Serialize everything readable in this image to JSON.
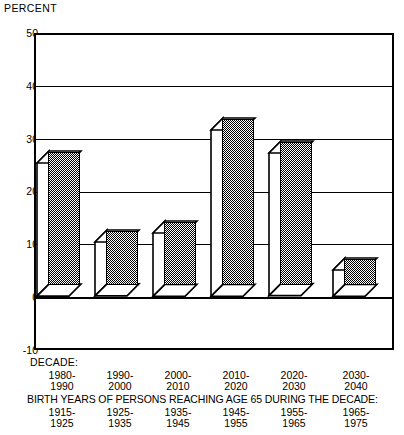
{
  "chart_data": {
    "type": "bar",
    "title": "",
    "ylabel": "PERCENT",
    "xlabel": "",
    "ylim": [
      -10,
      50
    ],
    "yticks": [
      50,
      40,
      30,
      20,
      10,
      0,
      -10
    ],
    "grid": true,
    "legend": false,
    "categories": [
      "1980-\n1990",
      "1990-\n2000",
      "2000-\n2010",
      "2010-\n2020",
      "2020-\n2030",
      "2030-\n2040"
    ],
    "values": [
      25.2,
      10.2,
      12.0,
      31.5,
      27.0,
      5.0
    ],
    "series": [
      {
        "name": "Percent increase",
        "values": [
          25.2,
          10.2,
          12.0,
          31.5,
          27.0,
          5.0
        ]
      }
    ],
    "decade_caption": "DECADE:",
    "decade_labels": [
      {
        "line1": "1980-",
        "line2": "1990"
      },
      {
        "line1": "1990-",
        "line2": "2000"
      },
      {
        "line1": "2000-",
        "line2": "2010"
      },
      {
        "line1": "2010-",
        "line2": "2020"
      },
      {
        "line1": "2020-",
        "line2": "2030"
      },
      {
        "line1": "2030-",
        "line2": "2040"
      }
    ],
    "birth_caption": "BIRTH YEARS OF PERSONS REACHING AGE 65 DURING THE DECADE:",
    "birth_labels": [
      {
        "line1": "1915-",
        "line2": "1925"
      },
      {
        "line1": "1925-",
        "line2": "1935"
      },
      {
        "line1": "1935-",
        "line2": "1945"
      },
      {
        "line1": "1945-",
        "line2": "1955"
      },
      {
        "line1": "1955-",
        "line2": "1965"
      },
      {
        "line1": "1965-",
        "line2": "1975"
      }
    ],
    "colors": {
      "bar_front": "#9d9d9d",
      "bar_side": "#ffffff",
      "outline": "#000000",
      "background": "#ffffff"
    }
  },
  "yticklabels": {
    "t50": "50",
    "t40": "40",
    "t30": "30",
    "t20": "20",
    "t10": "10",
    "t0": "0",
    "tm10": "-10"
  }
}
